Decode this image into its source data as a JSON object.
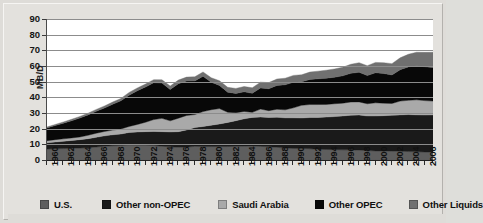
{
  "chart_data": {
    "type": "area",
    "stacked": true,
    "title": "",
    "xlabel": "",
    "ylabel": "MB/D",
    "ylim": [
      0,
      90
    ],
    "ytick_labels": [
      "0",
      "10",
      "20",
      "30",
      "40",
      "50",
      "60",
      "70",
      "80",
      "90"
    ],
    "ytick_values": [
      0,
      10,
      20,
      30,
      40,
      50,
      60,
      70,
      80,
      90
    ],
    "grid": true,
    "legend_position": "bottom",
    "x": [
      1960,
      1961,
      1962,
      1963,
      1964,
      1965,
      1966,
      1967,
      1968,
      1969,
      1970,
      1971,
      1972,
      1973,
      1974,
      1975,
      1976,
      1977,
      1978,
      1979,
      1980,
      1981,
      1982,
      1983,
      1984,
      1985,
      1986,
      1987,
      1988,
      1989,
      1990,
      1991,
      1992,
      1993,
      1994,
      1995,
      1996,
      1997,
      1998,
      1999,
      2000,
      2001,
      2002,
      2003,
      2004,
      2005,
      2006,
      2007
    ],
    "xtick_labels": [
      "1960",
      "1962",
      "1964",
      "1966",
      "1968",
      "1970",
      "1972",
      "1974",
      "1976",
      "1978",
      "1980",
      "1982",
      "1984",
      "1986",
      "1988",
      "1990",
      "1992",
      "1994",
      "1996",
      "1998",
      "2000",
      "2002",
      "2004",
      "2006"
    ],
    "series": [
      {
        "name": "U.S.",
        "color": "#5e5e5e",
        "values": [
          7.0,
          7.2,
          7.3,
          7.5,
          7.6,
          7.8,
          8.3,
          8.8,
          9.1,
          9.2,
          9.6,
          9.5,
          9.4,
          9.2,
          8.8,
          8.4,
          8.1,
          8.2,
          8.7,
          8.6,
          8.6,
          8.6,
          8.6,
          8.7,
          8.9,
          9.0,
          8.7,
          8.4,
          8.1,
          7.6,
          7.4,
          7.4,
          7.2,
          6.9,
          6.7,
          6.6,
          6.5,
          6.5,
          6.3,
          6.0,
          5.8,
          5.8,
          5.7,
          5.6,
          5.4,
          5.2,
          5.1,
          5.1
        ]
      },
      {
        "name": "Other non-OPEC",
        "color": "#1a1a1a",
        "values": [
          4.0,
          4.3,
          4.6,
          5.0,
          5.4,
          5.8,
          6.2,
          6.6,
          7.0,
          7.4,
          8.0,
          8.4,
          8.7,
          9.0,
          9.3,
          9.5,
          10.0,
          11.0,
          12.0,
          12.8,
          13.6,
          14.4,
          15.4,
          16.4,
          17.4,
          18.2,
          18.7,
          18.8,
          19.2,
          19.3,
          19.5,
          19.4,
          19.9,
          20.3,
          20.7,
          21.1,
          21.6,
          22.1,
          22.4,
          22.1,
          22.3,
          22.5,
          22.8,
          23.2,
          23.6,
          23.6,
          23.6,
          23.7
        ]
      },
      {
        "name": "Saudi Arabia",
        "color": "#a9a9a9",
        "values": [
          1.3,
          1.5,
          1.6,
          1.6,
          1.7,
          2.2,
          2.6,
          2.8,
          3.0,
          3.2,
          3.8,
          4.8,
          6.0,
          7.6,
          8.5,
          7.1,
          8.6,
          9.2,
          8.3,
          9.5,
          9.9,
          9.8,
          6.5,
          5.1,
          4.7,
          3.2,
          5.1,
          4.3,
          5.1,
          5.1,
          6.4,
          8.1,
          8.3,
          8.2,
          8.1,
          8.2,
          8.2,
          8.4,
          8.4,
          7.8,
          8.4,
          8.0,
          7.6,
          8.8,
          9.1,
          9.6,
          9.2,
          8.8
        ]
      },
      {
        "name": "Other OPEC",
        "color": "#080808",
        "values": [
          8.2,
          9.0,
          10.0,
          11.0,
          12.1,
          13.0,
          14.0,
          15.0,
          16.5,
          18.0,
          20.0,
          21.5,
          22.5,
          23.5,
          22.5,
          20.0,
          22.0,
          22.0,
          21.5,
          22.5,
          17.5,
          14.8,
          12.8,
          12.3,
          12.5,
          12.2,
          13.5,
          14.0,
          15.2,
          16.0,
          16.3,
          15.0,
          16.0,
          16.4,
          16.7,
          16.9,
          17.4,
          18.3,
          18.9,
          18.0,
          19.2,
          18.9,
          18.2,
          20.0,
          21.3,
          21.8,
          21.6,
          21.4
        ]
      },
      {
        "name": "Other Liquids",
        "color": "#707070",
        "values": [
          0.6,
          0.7,
          0.8,
          0.9,
          1.0,
          1.1,
          1.2,
          1.3,
          1.4,
          1.5,
          1.7,
          1.8,
          1.9,
          2.0,
          2.1,
          2.2,
          2.3,
          2.5,
          2.6,
          2.8,
          2.9,
          3.0,
          3.1,
          3.2,
          3.4,
          3.5,
          3.7,
          3.9,
          4.1,
          4.2,
          4.4,
          4.5,
          4.7,
          4.9,
          5.1,
          5.3,
          5.5,
          5.8,
          6.1,
          6.3,
          6.6,
          6.9,
          7.2,
          7.6,
          8.1,
          8.6,
          9.2,
          9.8
        ]
      }
    ],
    "totals_note": ""
  },
  "legend": {
    "items": [
      {
        "label": "U.S.",
        "color": "#5e5e5e"
      },
      {
        "label": "Other non-OPEC",
        "color": "#1a1a1a"
      },
      {
        "label": "Saudi Arabia",
        "color": "#a9a9a9"
      },
      {
        "label": "Other OPEC",
        "color": "#080808"
      },
      {
        "label": "Other Liquids",
        "color": "#707070"
      }
    ]
  },
  "axis": {
    "y_title": "MB/D"
  }
}
